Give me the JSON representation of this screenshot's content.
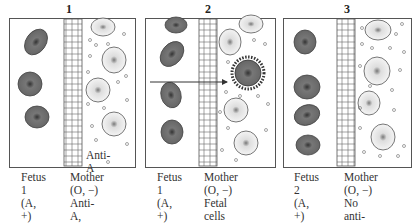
{
  "panels": [
    {
      "number": "1",
      "fetus_label": "Fetus 1\n(A, +)",
      "mother_label": "Mother (O, −)\nAnti-A, Anti-B\nin her serum",
      "annotation": "Anti-A"
    },
    {
      "number": "2",
      "fetus_label": "Fetus 1\n(A, +)",
      "mother_label": "Mother (O, −)\nFetal cells\nenter, Anti-A\ncoats cells"
    },
    {
      "number": "3",
      "fetus_label": "Fetus 2\n(A, +)",
      "mother_label": "Mother (O, −)\nNo anti-Rh\nin blood"
    }
  ],
  "colors": {
    "fetal_cell": "#6b6b6b",
    "maternal_cell": "#f2f2f2",
    "outline": "#555555"
  }
}
